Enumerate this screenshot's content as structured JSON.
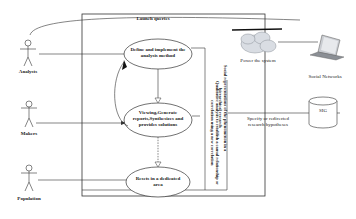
{
  "diagram": {
    "system_boundary_title": "Launch queries",
    "actors": [
      {
        "label": "Analysts"
      },
      {
        "label": "Makers"
      },
      {
        "label": "Population"
      }
    ],
    "use_cases": [
      {
        "label": "Define and implement the analysis method"
      },
      {
        "label": "Viewing,Generate reports,Synthesizes and provides solutions"
      },
      {
        "label": "Resets in a dedicated area"
      }
    ],
    "vertical_annotations": [
      {
        "text": "Qualitative analysis to establish a causal relationship or correlation using a new correlation"
      },
      {
        "text": "Social representations of the phenomenon in a hierarchical research"
      }
    ],
    "external": {
      "cloud_label": "Power the system",
      "laptop_label": "Social Networks",
      "database_label": "SIG",
      "database_link_label": "Specify or redirected research hypotheses"
    },
    "colors": {
      "line": "#333333",
      "cloud_fill": "#d9dde3",
      "background": "#ffffff"
    }
  }
}
